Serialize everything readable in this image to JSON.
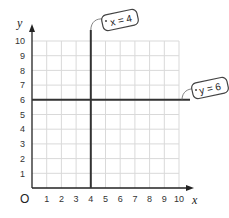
{
  "diagram": {
    "type": "coordinate-grid",
    "axes": {
      "x_label": "x",
      "y_label": "y",
      "origin_label": "O",
      "x_ticks": [
        "1",
        "2",
        "3",
        "4",
        "5",
        "6",
        "7",
        "8",
        "9",
        "10"
      ],
      "y_ticks": [
        "1",
        "2",
        "3",
        "4",
        "5",
        "6",
        "7",
        "8",
        "9",
        "10"
      ],
      "x_range": [
        0,
        10
      ],
      "y_range": [
        0,
        10
      ]
    },
    "lines": [
      {
        "equation": "x = 4",
        "orientation": "vertical",
        "value": 4,
        "label": "x = 4"
      },
      {
        "equation": "y = 6",
        "orientation": "horizontal",
        "value": 6,
        "label": "y = 6"
      }
    ],
    "colors": {
      "grid": "#d9d9d9",
      "axis": "#222222",
      "line": "#333333",
      "tag_border": "#444444"
    }
  }
}
